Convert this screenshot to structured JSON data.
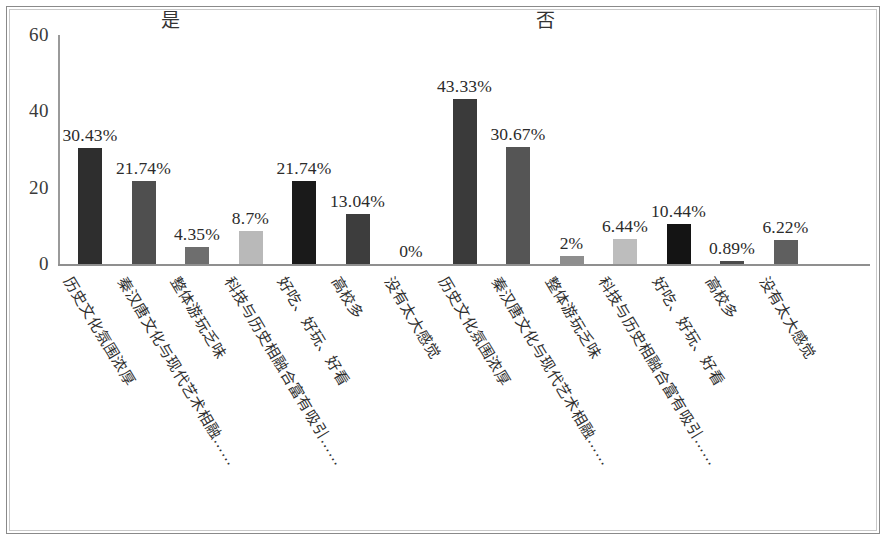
{
  "chart_data": {
    "type": "bar",
    "title": "",
    "xlabel": "",
    "ylabel": "",
    "ylim": [
      0,
      60
    ],
    "y_ticks": [
      0,
      20,
      40,
      60
    ],
    "grid": false,
    "legend": "none",
    "group_titles": [
      "是",
      "否"
    ],
    "categories": [
      "历史文化氛围浓厚",
      "秦汉唐文化与现代艺术相融……",
      "整体游玩乏味",
      "科技与历史相融合富有吸引……",
      "好吃、好玩、好看",
      "高校多",
      "没有太大感觉"
    ],
    "series": [
      {
        "name": "是",
        "values": [
          30.43,
          21.74,
          4.35,
          8.7,
          21.74,
          13.04,
          0
        ],
        "labels": [
          "30.43%",
          "21.74%",
          "4.35%",
          "8.7%",
          "21.74%",
          "13.04%",
          "0%"
        ],
        "colors": [
          "#2e2e2e",
          "#4f4f4f",
          "#6e6e6e",
          "#b9b9b9",
          "#1a1a1a",
          "#3d3d3d",
          "#777777"
        ]
      },
      {
        "name": "否",
        "values": [
          43.33,
          30.67,
          2,
          6.44,
          10.44,
          0.89,
          6.22
        ],
        "labels": [
          "43.33%",
          "30.67%",
          "2%",
          "6.44%",
          "10.44%",
          "0.89%",
          "6.22%"
        ],
        "colors": [
          "#3a3a3a",
          "#555555",
          "#8e8e8e",
          "#bdbdbd",
          "#141414",
          "#4a4a4a",
          "#5f5f5f"
        ]
      }
    ]
  },
  "axis": {
    "y_tick_labels": [
      "60",
      "40",
      "20",
      "0"
    ]
  }
}
